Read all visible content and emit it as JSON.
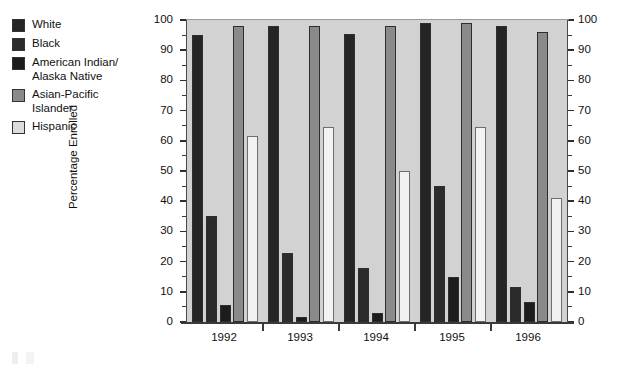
{
  "legend": {
    "items": [
      {
        "label": "White",
        "color": "#252525"
      },
      {
        "label": "Black",
        "color": "#2b2b2b"
      },
      {
        "label": "American Indian/\nAlaska Native",
        "color": "#1c1c1c"
      },
      {
        "label": "Asian-Pacific\nIslander",
        "color": "#8a8a8a"
      },
      {
        "label": "Hispanic",
        "color": "#dcdcdc"
      }
    ]
  },
  "axes": {
    "y_title": "Percentage Enrolled",
    "y_ticks": [
      "0",
      "10",
      "20",
      "30",
      "40",
      "50",
      "60",
      "70",
      "80",
      "90",
      "100"
    ],
    "y_min": 0,
    "y_max": 100,
    "x_ticks": [
      "1992",
      "1993",
      "1994",
      "1995",
      "1996"
    ]
  },
  "chart_data": {
    "type": "bar",
    "title": "",
    "xlabel": "",
    "ylabel": "Percentage Enrolled",
    "ylim": [
      0,
      100
    ],
    "grid": false,
    "legend_position": "left-outside",
    "dual_y_axis": true,
    "categories": [
      "1992",
      "1993",
      "1994",
      "1995",
      "1996"
    ],
    "series": [
      {
        "name": "White",
        "color": "#252525",
        "values": [
          95,
          98,
          95.5,
          99,
          98
        ]
      },
      {
        "name": "Black",
        "color": "#2b2b2b",
        "values": [
          35,
          23,
          18,
          45,
          11.5
        ]
      },
      {
        "name": "American Indian/Alaska Native",
        "color": "#1c1c1c",
        "values": [
          5.5,
          1.5,
          3,
          15,
          6.5
        ]
      },
      {
        "name": "Asian-Pacific Islander",
        "color": "#8a8a8a",
        "values": [
          98,
          98,
          98,
          99,
          96
        ]
      },
      {
        "name": "Hispanic",
        "color": "#f2f2f2",
        "values": [
          61.5,
          64.5,
          50,
          64.5,
          41
        ]
      }
    ]
  }
}
